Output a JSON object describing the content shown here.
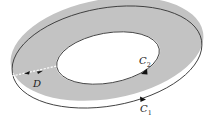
{
  "diagram": {
    "type": "annular-region",
    "colors": {
      "region_fill": "#c3c3c3",
      "stroke": "#3a3a3a",
      "hole_fill": "#ffffff",
      "cut_line": "#ffffff",
      "arrow": "#111111"
    },
    "outer_curve": {
      "name": "C",
      "subscript": "1",
      "orientation": "counterclockwise"
    },
    "inner_curve": {
      "name": "C",
      "subscript": "2",
      "orientation": "clockwise"
    },
    "region_label": "D",
    "cut": {
      "style": "dashed",
      "arrows": 2
    }
  }
}
